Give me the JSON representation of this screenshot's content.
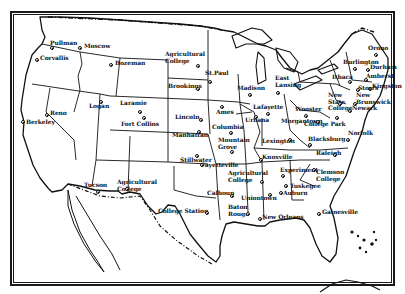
{
  "map": {
    "title": "",
    "region": "United States",
    "colors": {
      "ink": "#111111",
      "paper": "#ffffff"
    },
    "cities": [
      {
        "name": "Pullman",
        "x": 50,
        "y": 43,
        "dx": 52,
        "dy": 48
      },
      {
        "name": "Moscow",
        "x": 84,
        "y": 46,
        "dx": 80,
        "dy": 48
      },
      {
        "name": "Corvallis",
        "x": 40,
        "y": 58,
        "dx": 37,
        "dy": 60
      },
      {
        "name": "Bozeman",
        "x": 115,
        "y": 63,
        "dx": 111,
        "dy": 65
      },
      {
        "name": "Agricultural\nCollege",
        "x": 165,
        "y": 54,
        "dx": 198,
        "dy": 66
      },
      {
        "name": "St.Paul",
        "x": 205,
        "y": 73,
        "dx": 210,
        "dy": 82
      },
      {
        "name": "Brookings",
        "x": 168,
        "y": 86,
        "dx": 198,
        "dy": 89
      },
      {
        "name": "Logan",
        "x": 89,
        "y": 106,
        "dx": 101,
        "dy": 102
      },
      {
        "name": "Laramie",
        "x": 120,
        "y": 103,
        "dx": 140,
        "dy": 112
      },
      {
        "name": "Reno",
        "x": 50,
        "y": 113,
        "dx": 47,
        "dy": 115
      },
      {
        "name": "Berkeley",
        "x": 26,
        "y": 122,
        "dx": 23,
        "dy": 122
      },
      {
        "name": "Fort Collins",
        "x": 121,
        "y": 124,
        "dx": 144,
        "dy": 118
      },
      {
        "name": "Lincoln",
        "x": 175,
        "y": 117,
        "dx": 201,
        "dy": 120
      },
      {
        "name": "Manhattan",
        "x": 172,
        "y": 135,
        "dx": 199,
        "dy": 132
      },
      {
        "name": "Ames",
        "x": 216,
        "y": 112,
        "dx": 222,
        "dy": 107
      },
      {
        "name": "Madison",
        "x": 237,
        "y": 88,
        "dx": 250,
        "dy": 95
      },
      {
        "name": "East\nLansing",
        "x": 275,
        "y": 78,
        "dx": 278,
        "dy": 93
      },
      {
        "name": "Lafayette",
        "x": 253,
        "y": 107,
        "dx": 268,
        "dy": 114
      },
      {
        "name": "Urbana",
        "x": 245,
        "y": 120,
        "dx": 256,
        "dy": 117
      },
      {
        "name": "Columbia",
        "x": 212,
        "y": 127,
        "dx": 231,
        "dy": 133
      },
      {
        "name": "Mountain\nGrove",
        "x": 218,
        "y": 140,
        "dx": 232,
        "dy": 152
      },
      {
        "name": "Wooster",
        "x": 295,
        "y": 109,
        "dx": 306,
        "dy": 116
      },
      {
        "name": "Morgantown",
        "x": 281,
        "y": 121,
        "dx": 318,
        "dy": 122
      },
      {
        "name": "College Park",
        "x": 304,
        "y": 124,
        "dx": 337,
        "dy": 118
      },
      {
        "name": "New\nState\nCollege",
        "x": 328,
        "y": 95,
        "dx": 340,
        "dy": 104
      },
      {
        "name": "New\nBrunswick",
        "x": 356,
        "y": 95,
        "dx": 355,
        "dy": 104
      },
      {
        "name": "Newark",
        "x": 352,
        "y": 108,
        "dx": 350,
        "dy": 111
      },
      {
        "name": "Blacksburg",
        "x": 308,
        "y": 139,
        "dx": 310,
        "dy": 145
      },
      {
        "name": "Norfolk",
        "x": 348,
        "y": 133,
        "dx": 348,
        "dy": 140
      },
      {
        "name": "Lexington",
        "x": 262,
        "y": 141,
        "dx": 290,
        "dy": 140
      },
      {
        "name": "Stillwater",
        "x": 180,
        "y": 160,
        "dx": 197,
        "dy": 156
      },
      {
        "name": "Knoxville",
        "x": 262,
        "y": 157,
        "dx": 261,
        "dy": 160
      },
      {
        "name": "Raleigh",
        "x": 316,
        "y": 153,
        "dx": 335,
        "dy": 155
      },
      {
        "name": "Fayetteville",
        "x": 201,
        "y": 165,
        "dx": 202,
        "dy": 165
      },
      {
        "name": "Agricultural\nCollege",
        "x": 228,
        "y": 173,
        "dx": 262,
        "dy": 182
      },
      {
        "name": "Experiment",
        "x": 280,
        "y": 170,
        "dx": 283,
        "dy": 176
      },
      {
        "name": "Clemson\nCollege",
        "x": 316,
        "y": 172,
        "dx": 314,
        "dy": 170
      },
      {
        "name": "Tuskegee",
        "x": 290,
        "y": 186,
        "dx": 286,
        "dy": 186
      },
      {
        "name": "Auburn",
        "x": 283,
        "y": 193,
        "dx": 281,
        "dy": 193
      },
      {
        "name": "Calhoun",
        "x": 207,
        "y": 193,
        "dx": 232,
        "dy": 196
      },
      {
        "name": "Uniontown",
        "x": 241,
        "y": 198,
        "dx": 270,
        "dy": 195
      },
      {
        "name": "Baton\nRouge",
        "x": 228,
        "y": 207,
        "dx": 248,
        "dy": 214
      },
      {
        "name": "New Orleans",
        "x": 262,
        "y": 217,
        "dx": 260,
        "dy": 219
      },
      {
        "name": "College Station",
        "x": 158,
        "y": 211,
        "dx": 207,
        "dy": 213
      },
      {
        "name": "Gainesville",
        "x": 322,
        "y": 212,
        "dx": 319,
        "dy": 214
      },
      {
        "name": "Tucson",
        "x": 84,
        "y": 185,
        "dx": 98,
        "dy": 192
      },
      {
        "name": "Agricultural\nCollege",
        "x": 117,
        "y": 182,
        "dx": 127,
        "dy": 189
      },
      {
        "name": "Orono",
        "x": 368,
        "y": 48,
        "dx": 376,
        "dy": 55
      },
      {
        "name": "Burlington",
        "x": 343,
        "y": 62,
        "dx": 355,
        "dy": 69
      },
      {
        "name": "Durham",
        "x": 370,
        "y": 67,
        "dx": 368,
        "dy": 70
      },
      {
        "name": "Amherst",
        "x": 366,
        "y": 76,
        "dx": 366,
        "dy": 80
      },
      {
        "name": "Kingston",
        "x": 372,
        "y": 86,
        "dx": 370,
        "dy": 89
      },
      {
        "name": "Ithaca",
        "x": 332,
        "y": 77,
        "dx": 350,
        "dy": 82
      },
      {
        "name": "Storrs",
        "x": 358,
        "y": 88,
        "dx": 358,
        "dy": 90
      }
    ]
  }
}
